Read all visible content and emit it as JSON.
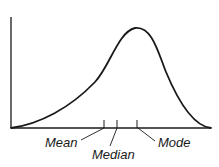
{
  "diagram": {
    "curve": {
      "type": "left-skewed density",
      "start": [
        11,
        128
      ],
      "peak": [
        135,
        28
      ],
      "end": [
        211,
        128
      ],
      "color": "#1a1a1a"
    },
    "axes": {
      "y_axis": {
        "x": 11,
        "y_top": 17,
        "y_bottom": 128
      },
      "x_axis": {
        "y": 128,
        "x_left": 11,
        "x_right": 211
      }
    },
    "markers": [
      {
        "label": "Mean",
        "tick_x": 104
      },
      {
        "label": "Median",
        "tick_x": 117
      },
      {
        "label": "Mode",
        "tick_x": 138
      }
    ]
  }
}
